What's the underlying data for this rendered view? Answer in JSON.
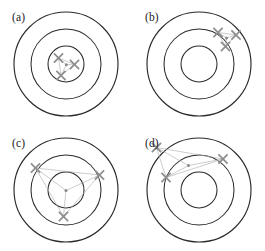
{
  "figure": {
    "background_color": "#ffffff",
    "ring_color": "#2b2b2b",
    "mark_color": "#8d8d8d",
    "connector_color": "#b0b0b0",
    "centroid_color": "#8a8a8a",
    "panel_width": 132,
    "panel_height": 125,
    "ring_radii": [
      52,
      35,
      18
    ],
    "mark_size": 4.6,
    "centroid_radius": 1.5
  },
  "chart_data": {
    "type": "scatter",
    "xlabel": "",
    "ylabel": "",
    "grid": false,
    "legend": "none",
    "axis_note": "Coordinates are in panel-local pixels; panel origin is the target center.",
    "xlim": [
      -56,
      56
    ],
    "ylim": [
      -56,
      56
    ],
    "shared_geometry": {
      "ring_radii": [
        52,
        35,
        18
      ],
      "center": [
        0,
        0
      ]
    },
    "panels": [
      {
        "label": "(a)",
        "label_pos": [
          12,
          12
        ],
        "center": [
          66,
          64
        ],
        "centroid": [
          0.3,
          0.7
        ],
        "points": [
          [
            -7.5,
            -6.0
          ],
          [
            8.5,
            0.5
          ],
          [
            -5.0,
            11.5
          ]
        ]
      },
      {
        "label": "(b)",
        "label_pos": [
          12,
          12
        ],
        "center": [
          66,
          64
        ],
        "centroid": [
          27.5,
          -26.0
        ],
        "points": [
          [
            19.0,
            -31.5
          ],
          [
            37.0,
            -29.0
          ],
          [
            26.5,
            -17.5
          ]
        ]
      },
      {
        "label": "(c)",
        "label_pos": [
          12,
          12
        ],
        "center": [
          66,
          64
        ],
        "centroid": [
          0.0,
          0.5
        ],
        "points": [
          [
            -30.5,
            -22.0
          ],
          [
            33.5,
            -15.0
          ],
          [
            -2.5,
            26.5
          ]
        ]
      },
      {
        "label": "(d)",
        "label_pos": [
          12,
          12
        ],
        "center": [
          66,
          64
        ],
        "centroid": [
          -10.5,
          -24.5
        ],
        "points": [
          [
            -42.5,
            -42.5
          ],
          [
            24.0,
            -31.0
          ],
          [
            -33.0,
            -12.5
          ]
        ]
      }
    ]
  },
  "panels": {
    "a": {
      "label": "(a)"
    },
    "b": {
      "label": "(b)"
    },
    "c": {
      "label": "(c)"
    },
    "d": {
      "label": "(d)"
    }
  }
}
